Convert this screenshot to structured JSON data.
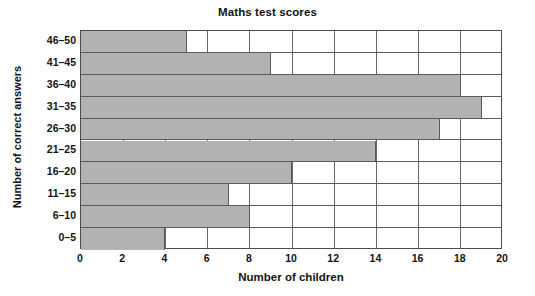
{
  "chart_data": {
    "type": "bar",
    "orientation": "horizontal",
    "title": "Maths test scores",
    "xlabel": "Number of children",
    "ylabel": "Number of correct answers",
    "categories": [
      "0–5",
      "6–10",
      "11–15",
      "16–20",
      "21–25",
      "26–30",
      "31–35",
      "36–40",
      "41–45",
      "46–50"
    ],
    "values": [
      4,
      8,
      7,
      10,
      14,
      17,
      19,
      18,
      9,
      5
    ],
    "xlim": [
      0,
      20
    ],
    "xticks": [
      0,
      2,
      4,
      6,
      8,
      10,
      12,
      14,
      16,
      18,
      20
    ],
    "xtick_labels": [
      "0",
      "2",
      "4",
      "6",
      "8",
      "10",
      "12",
      "14",
      "16",
      "18",
      "20"
    ],
    "grid": "vertical",
    "legend": "none",
    "bar_color": "#b2b2b2",
    "bar_edge_color": "#5a5a5a",
    "axis_color": "#4d4d4d",
    "background": "#ffffff"
  }
}
